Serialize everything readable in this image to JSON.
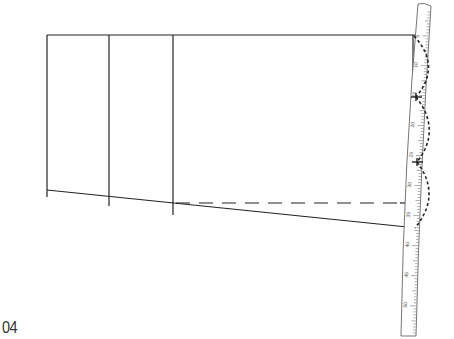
{
  "figure": {
    "step_label": "04",
    "colors": {
      "line": "#222222",
      "ruler_outline": "#666666",
      "ruler_ticks": "#666666",
      "background": "#ffffff"
    },
    "ruler": {
      "type": "curved-ruler",
      "numbers": [
        "5",
        "10",
        "15",
        "20",
        "25",
        "30",
        "35",
        "40",
        "45",
        "50"
      ]
    }
  }
}
